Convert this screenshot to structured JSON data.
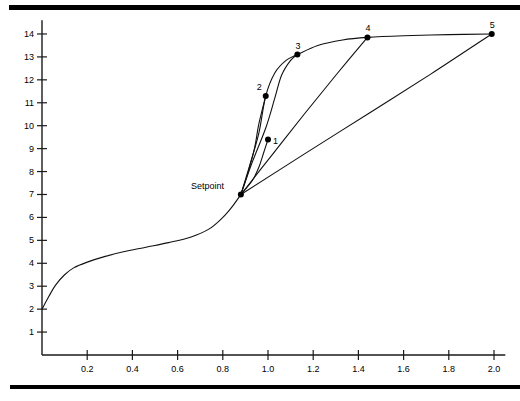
{
  "chart_data": {
    "type": "line",
    "title": "",
    "xlabel": "",
    "ylabel": "",
    "xlim": [
      0.0,
      2.05
    ],
    "ylim": [
      0.0,
      14.6
    ],
    "grid": false,
    "legend": null,
    "x_ticks": [
      0.2,
      0.4,
      0.6,
      0.8,
      1.0,
      1.2,
      1.4,
      1.6,
      1.8,
      2.0
    ],
    "x_tick_labels": [
      "0.2",
      "0.4",
      "0.6",
      "0.8",
      "1.0",
      "1.2",
      "1.4",
      "1.6",
      "1.8",
      "2.0"
    ],
    "y_ticks": [
      1,
      2,
      3,
      4,
      5,
      6,
      7,
      8,
      9,
      10,
      11,
      12,
      13,
      14
    ],
    "y_tick_labels": [
      "1",
      "2",
      "3",
      "4",
      "5",
      "6",
      "7",
      "8",
      "9",
      "10",
      "11",
      "12",
      "13",
      "14"
    ],
    "annotations": [
      {
        "text": "Setpoint",
        "x": 0.88,
        "y": 7.0
      },
      {
        "text": "1",
        "x": 1.0,
        "y": 9.4
      },
      {
        "text": "2",
        "x": 0.99,
        "y": 11.3
      },
      {
        "text": "3",
        "x": 1.13,
        "y": 13.1
      },
      {
        "text": "4",
        "x": 1.44,
        "y": 13.85
      },
      {
        "text": "5",
        "x": 1.99,
        "y": 14.0
      }
    ],
    "markers": [
      {
        "name": "setpoint",
        "x": 0.88,
        "y": 7.0,
        "label": "Setpoint"
      },
      {
        "name": "endpoint-1",
        "x": 1.0,
        "y": 9.4,
        "label": "1"
      },
      {
        "name": "endpoint-2",
        "x": 0.99,
        "y": 11.3,
        "label": "2"
      },
      {
        "name": "endpoint-3",
        "x": 1.13,
        "y": 13.1,
        "label": "3"
      },
      {
        "name": "endpoint-4",
        "x": 1.44,
        "y": 13.85,
        "label": "4"
      },
      {
        "name": "endpoint-5",
        "x": 1.99,
        "y": 14.0,
        "label": "5"
      }
    ],
    "series": [
      {
        "name": "load-curve",
        "type": "line",
        "points": [
          [
            0.0,
            2.0
          ],
          [
            0.03,
            2.55
          ],
          [
            0.06,
            3.05
          ],
          [
            0.1,
            3.5
          ],
          [
            0.14,
            3.8
          ],
          [
            0.2,
            4.05
          ],
          [
            0.28,
            4.3
          ],
          [
            0.36,
            4.5
          ],
          [
            0.46,
            4.7
          ],
          [
            0.56,
            4.9
          ],
          [
            0.66,
            5.15
          ],
          [
            0.74,
            5.5
          ],
          [
            0.8,
            6.0
          ],
          [
            0.84,
            6.45
          ],
          [
            0.88,
            7.0
          ]
        ]
      },
      {
        "name": "trajectory-1",
        "type": "line",
        "points": [
          [
            0.88,
            7.0
          ],
          [
            0.93,
            7.6
          ],
          [
            0.96,
            8.2
          ],
          [
            0.98,
            8.8
          ],
          [
            1.0,
            9.4
          ]
        ]
      },
      {
        "name": "trajectory-2",
        "type": "line",
        "points": [
          [
            0.88,
            7.0
          ],
          [
            0.91,
            7.9
          ],
          [
            0.94,
            9.0
          ],
          [
            0.96,
            10.1
          ],
          [
            0.99,
            11.3
          ]
        ]
      },
      {
        "name": "trajectory-3",
        "type": "line",
        "points": [
          [
            0.88,
            7.0
          ],
          [
            0.93,
            8.4
          ],
          [
            0.99,
            9.9
          ],
          [
            1.03,
            11.2
          ],
          [
            1.06,
            12.2
          ],
          [
            1.1,
            12.85
          ],
          [
            1.13,
            13.1
          ]
        ]
      },
      {
        "name": "trajectory-4",
        "type": "line",
        "points": [
          [
            0.88,
            7.0
          ],
          [
            1.02,
            8.75
          ],
          [
            1.16,
            10.5
          ],
          [
            1.3,
            12.2
          ],
          [
            1.44,
            13.85
          ]
        ]
      },
      {
        "name": "trajectory-5",
        "type": "line",
        "points": [
          [
            0.88,
            7.0
          ],
          [
            1.16,
            8.76
          ],
          [
            1.44,
            10.5
          ],
          [
            1.72,
            12.25
          ],
          [
            1.99,
            14.0
          ]
        ]
      },
      {
        "name": "upper-envelope",
        "type": "line",
        "points": [
          [
            0.88,
            7.0
          ],
          [
            0.92,
            8.3
          ],
          [
            0.96,
            9.7
          ],
          [
            0.99,
            11.3
          ],
          [
            1.03,
            12.3
          ],
          [
            1.08,
            12.85
          ],
          [
            1.13,
            13.1
          ],
          [
            1.22,
            13.5
          ],
          [
            1.33,
            13.74
          ],
          [
            1.44,
            13.85
          ],
          [
            1.6,
            13.92
          ],
          [
            1.8,
            13.97
          ],
          [
            1.99,
            14.0
          ]
        ]
      }
    ]
  },
  "axes": {
    "y_axis_name": "value-axis",
    "x_axis_name": "time-axis"
  }
}
